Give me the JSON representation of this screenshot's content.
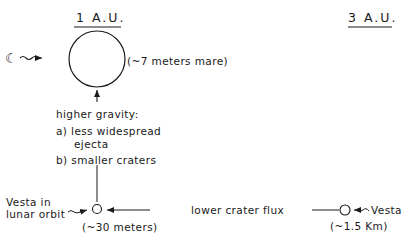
{
  "headings": {
    "left": "1 A.U.",
    "right": "3 A.U."
  },
  "moon": {
    "icon": "crescent-moon-icon",
    "glyph": "☾",
    "size_label": "(~7 meters mare)"
  },
  "gravity_note": {
    "title": "higher gravity:",
    "items": [
      "a) less widespread",
      "ejecta",
      "b) smaller craters"
    ]
  },
  "vesta_lunar": {
    "label_line1": "Vesta in",
    "label_line2": "lunar orbit",
    "size_label": "(~30 meters)"
  },
  "flux_label": "lower crater flux",
  "vesta_3au": {
    "label": "Vesta",
    "size_label": "(~1.5 Km)"
  },
  "colors": {
    "ink": "#1a1a1a",
    "background": "#ffffff"
  }
}
